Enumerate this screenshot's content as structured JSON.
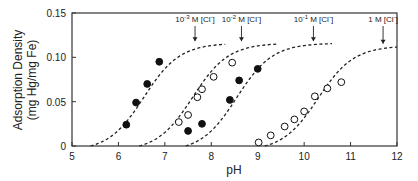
{
  "chart_data": {
    "type": "scatter",
    "title": "",
    "xlabel": "pH",
    "ylabel": "Adsorption Density",
    "ylabel_units": "(mg Hg/mg Fe)",
    "xlim": [
      5,
      12
    ],
    "ylim": [
      0,
      0.15
    ],
    "x_ticks": [
      5,
      6,
      7,
      8,
      9,
      10,
      11,
      12
    ],
    "x_tick_labels": [
      "5",
      "6",
      "7",
      "8",
      "9",
      "10",
      "11",
      "12"
    ],
    "y_ticks": [
      0,
      0.05,
      0.1,
      0.15
    ],
    "y_tick_labels": [
      "0",
      "0.05",
      "0.10",
      "0.15"
    ],
    "grid": false,
    "series": [
      {
        "name": "10-3 M [Cl-]",
        "label_base": "10",
        "label_exp": "-3",
        "label_rest": " M [Cl",
        "marker": "filled",
        "points": [
          [
            6.17,
            0.024
          ],
          [
            6.38,
            0.049
          ],
          [
            6.62,
            0.07
          ],
          [
            6.88,
            0.095
          ]
        ],
        "curve": {
          "start": 5.4,
          "mid": 6.55,
          "end": 8.3,
          "plateau": 0.116,
          "k": 2.6
        },
        "arrow_x": 7.65
      },
      {
        "name": "10-2 M [Cl-]",
        "label_base": "10",
        "label_exp": "-2",
        "label_rest": " M [Cl",
        "marker": "open",
        "points": [
          [
            7.3,
            0.027
          ],
          [
            7.5,
            0.035
          ],
          [
            7.7,
            0.055
          ],
          [
            7.8,
            0.064
          ],
          [
            8.05,
            0.078
          ],
          [
            8.45,
            0.094
          ]
        ],
        "curve": {
          "start": 6.45,
          "mid": 7.6,
          "end": 9.4,
          "plateau": 0.116,
          "k": 2.6
        },
        "arrow_x": 8.65
      },
      {
        "name": "10-1 M [Cl-]",
        "label_base": "10",
        "label_exp": "-1",
        "label_rest": " M [Cl",
        "marker": "filled",
        "points": [
          [
            7.5,
            0.017
          ],
          [
            7.8,
            0.025
          ],
          [
            8.4,
            0.052
          ],
          [
            8.6,
            0.074
          ],
          [
            9.0,
            0.087
          ]
        ],
        "curve": {
          "start": 7.45,
          "mid": 8.55,
          "end": 10.6,
          "plateau": 0.116,
          "k": 2.6
        },
        "arrow_x": 10.2
      },
      {
        "name": "1 M [Cl-]",
        "label_base": "1",
        "label_exp": "",
        "label_rest": " M [Cl",
        "marker": "open",
        "points": [
          [
            9.02,
            0.004
          ],
          [
            9.28,
            0.012
          ],
          [
            9.58,
            0.022
          ],
          [
            9.79,
            0.03
          ],
          [
            10.0,
            0.039
          ],
          [
            10.23,
            0.056
          ],
          [
            10.5,
            0.065
          ],
          [
            10.8,
            0.072
          ]
        ],
        "curve": {
          "start": 9.15,
          "mid": 10.3,
          "end": 12.0,
          "plateau": 0.113,
          "k": 2.6
        },
        "arrow_x": 11.7
      }
    ]
  }
}
